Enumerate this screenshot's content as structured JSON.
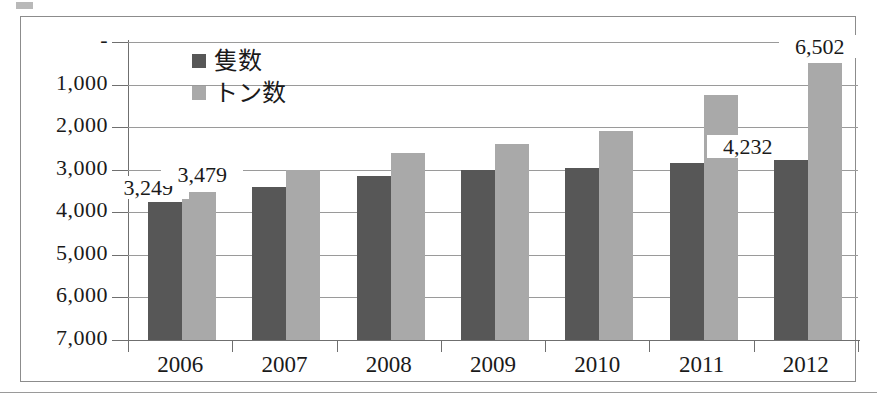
{
  "chart_data": {
    "type": "bar",
    "title": "",
    "xlabel": "",
    "ylabel": "",
    "categories": [
      "2006",
      "2007",
      "2008",
      "2009",
      "2010",
      "2011",
      "2012"
    ],
    "series": [
      {
        "name": "隻数",
        "color": "#575757",
        "values": [
          3249,
          3600,
          3850,
          4000,
          4050,
          4150,
          4232
        ]
      },
      {
        "name": "トン数",
        "color": "#a9a9a9",
        "values": [
          3479,
          4000,
          4400,
          4600,
          4900,
          5750,
          6502
        ]
      }
    ],
    "ylim": [
      0,
      7000
    ],
    "ytick_values": [
      0,
      1000,
      2000,
      3000,
      4000,
      5000,
      6000,
      7000
    ],
    "ytick_labels": [
      "-",
      "1,000",
      "2,000",
      "3,000",
      "4,000",
      "5,000",
      "6,000",
      "7,000"
    ],
    "grid": true,
    "legend_position": "top-left-inside",
    "data_labels": [
      {
        "category": "2006",
        "series": "隻数",
        "text": "3,249"
      },
      {
        "category": "2006",
        "series": "トン数",
        "text": "3,479"
      },
      {
        "category": "2012",
        "series": "隻数",
        "text": "4,232"
      },
      {
        "category": "2012",
        "series": "トン数",
        "text": "6,502"
      }
    ]
  },
  "legend": {
    "items": [
      {
        "label": "隻数",
        "color": "#575757"
      },
      {
        "label": "トン数",
        "color": "#a9a9a9"
      }
    ]
  },
  "axis": {
    "y_labels": [
      "7,000",
      "6,000",
      "5,000",
      "4,000",
      "3,000",
      "2,000",
      "1,000",
      "-"
    ],
    "x_labels": [
      "2006",
      "2007",
      "2008",
      "2009",
      "2010",
      "2011",
      "2012"
    ]
  }
}
